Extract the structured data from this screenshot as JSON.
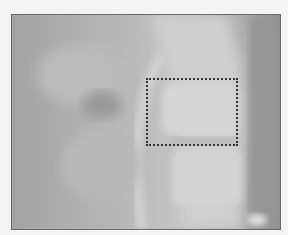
{
  "image": {
    "subject": "lateral radiograph of cervical spine",
    "palette": "grayscale"
  },
  "annotation": {
    "type": "dotted-rectangle",
    "color": "#333333"
  }
}
